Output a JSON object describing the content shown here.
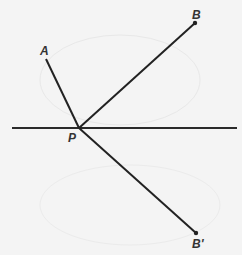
{
  "diagram": {
    "type": "geometry-reflection",
    "points": {
      "A": {
        "label": "A",
        "x": 46,
        "y": 59
      },
      "B": {
        "label": "B",
        "x": 195,
        "y": 23
      },
      "P": {
        "label": "P",
        "x": 79,
        "y": 128
      },
      "B_prime": {
        "label": "B'",
        "x": 196,
        "y": 233
      }
    },
    "line": {
      "x1": 12,
      "y1": 128,
      "x2": 237,
      "y2": 128
    },
    "segments": [
      {
        "from": "A",
        "to": "P"
      },
      {
        "from": "P",
        "to": "B"
      },
      {
        "from": "P",
        "to": "B_prime"
      }
    ],
    "colors": {
      "line": "#222222",
      "background": "#f4f4f4",
      "faint_arc": "#e6e6e6"
    }
  }
}
